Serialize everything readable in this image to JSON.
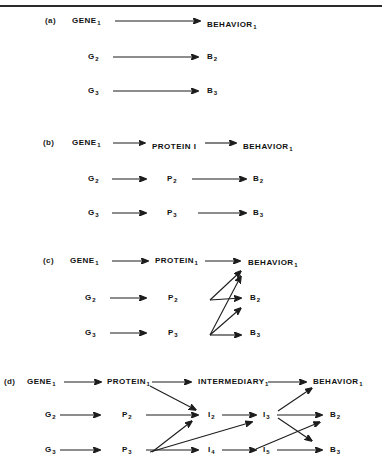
{
  "figure": {
    "type": "diagram",
    "background_color": "#ffffff",
    "line_color": "#1d1d1d",
    "top_rule": true
  },
  "panels": [
    {
      "key": "a",
      "label": "(a)",
      "columns": [
        "GENE",
        "BEHAVIOR"
      ],
      "rows": [
        {
          "nodes": [
            "GENE 1",
            "BEHAVIOR 1"
          ]
        },
        {
          "nodes": [
            "G 2",
            "B 2"
          ]
        },
        {
          "nodes": [
            "G 3",
            "B 3"
          ]
        }
      ],
      "node_labels": {
        "g1": "GENE",
        "g1sub": "1",
        "g2": "G",
        "g2sub": "2",
        "g3": "G",
        "g3sub": "3",
        "b1": "BEHAVIOR",
        "b1sub": "1",
        "b2": "B",
        "b2sub": "2",
        "b3": "B",
        "b3sub": "3"
      },
      "edges": [
        {
          "from": "g1",
          "to": "b1"
        },
        {
          "from": "g2",
          "to": "b2"
        },
        {
          "from": "g3",
          "to": "b3"
        }
      ]
    },
    {
      "key": "b",
      "label": "(b)",
      "columns": [
        "GENE",
        "PROTEIN",
        "BEHAVIOR"
      ],
      "node_labels": {
        "g1": "GENE",
        "g1sub": "1",
        "g2": "G",
        "g2sub": "2",
        "g3": "G",
        "g3sub": "3",
        "p1": "PROTEIN I",
        "p1sub": "",
        "p2": "P",
        "p2sub": "2",
        "p3": "P",
        "p3sub": "3",
        "b1": "BEHAVIOR",
        "b1sub": "1",
        "b2": "B",
        "b2sub": "2",
        "b3": "B",
        "b3sub": "3"
      },
      "edges": [
        {
          "from": "g1",
          "to": "p1"
        },
        {
          "from": "p1",
          "to": "b1"
        },
        {
          "from": "g2",
          "to": "p2"
        },
        {
          "from": "p2",
          "to": "b2"
        },
        {
          "from": "g3",
          "to": "p3"
        },
        {
          "from": "p3",
          "to": "b3"
        }
      ]
    },
    {
      "key": "c",
      "label": "(c)",
      "columns": [
        "GENE",
        "PROTEIN",
        "BEHAVIOR"
      ],
      "node_labels": {
        "g1": "GENE",
        "g1sub": "1",
        "g2": "G",
        "g2sub": "2",
        "g3": "G",
        "g3sub": "3",
        "p1": "PROTEIN",
        "p1sub": "1",
        "p2": "P",
        "p2sub": "2",
        "p3": "P",
        "p3sub": "3",
        "b1": "BEHAVIOR",
        "b1sub": "1",
        "b2": "B",
        "b2sub": "2",
        "b3": "B",
        "b3sub": "3"
      },
      "edges": [
        {
          "from": "g1",
          "to": "p1"
        },
        {
          "from": "g2",
          "to": "p2"
        },
        {
          "from": "g3",
          "to": "p3"
        },
        {
          "from": "p1",
          "to": "b1"
        },
        {
          "from": "p2",
          "to": "b1"
        },
        {
          "from": "p2",
          "to": "b2"
        },
        {
          "from": "p3",
          "to": "b2"
        },
        {
          "from": "p3",
          "to": "b3"
        }
      ]
    },
    {
      "key": "d",
      "label": "(d)",
      "columns": [
        "GENE",
        "PROTEIN",
        "INTERMEDIARY",
        "BEHAVIOR"
      ],
      "node_labels": {
        "g1": "GENE",
        "g1sub": "1",
        "g2": "G",
        "g2sub": "2",
        "g3": "G",
        "g3sub": "3",
        "p1": "PROTEIN",
        "p1sub": "1",
        "p2": "P",
        "p2sub": "2",
        "p3": "P",
        "p3sub": "3",
        "i1": "INTERMEDIARY",
        "i1sub": "1",
        "i2": "I",
        "i2sub": "2",
        "i3": "I",
        "i3sub": "3",
        "i4": "I",
        "i4sub": "4",
        "i5": "I",
        "i5sub": "5",
        "b1": "BEHAVIOR",
        "b1sub": "1",
        "b2": "B",
        "b2sub": "2",
        "b3": "B",
        "b3sub": "3"
      },
      "edges": [
        {
          "from": "g1",
          "to": "p1"
        },
        {
          "from": "g2",
          "to": "p2"
        },
        {
          "from": "g3",
          "to": "p3"
        },
        {
          "from": "p1",
          "to": "i1"
        },
        {
          "from": "p1",
          "to": "i2"
        },
        {
          "from": "p2",
          "to": "i2"
        },
        {
          "from": "p3",
          "to": "i2"
        },
        {
          "from": "p3",
          "to": "i4"
        },
        {
          "from": "p3",
          "to": "i3"
        },
        {
          "from": "i1",
          "to": "b1"
        },
        {
          "from": "i2",
          "to": "i3"
        },
        {
          "from": "i4",
          "to": "i5"
        },
        {
          "from": "i3",
          "to": "b1"
        },
        {
          "from": "i3",
          "to": "b2"
        },
        {
          "from": "i3",
          "to": "b3"
        },
        {
          "from": "i5",
          "to": "b2"
        },
        {
          "from": "i5",
          "to": "b3"
        }
      ]
    }
  ]
}
